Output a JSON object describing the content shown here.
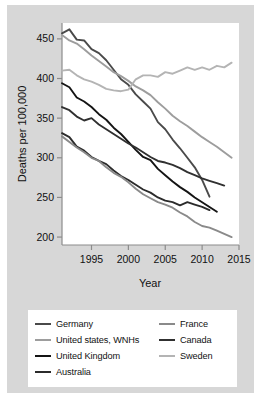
{
  "chart_data": {
    "type": "line",
    "title": "",
    "xlabel": "Year",
    "ylabel": "Deaths per 100,000",
    "xlim": [
      1991,
      2015
    ],
    "ylim": [
      190,
      470
    ],
    "xticks": [
      1995,
      2000,
      2005,
      2010,
      2015
    ],
    "yticks": [
      200,
      250,
      300,
      350,
      400,
      450
    ],
    "xtick_labels": [
      "1995",
      "2000",
      "2005",
      "2010",
      "2015"
    ],
    "ytick_labels": [
      "200",
      "250",
      "300",
      "350",
      "400",
      "450"
    ],
    "grid": false,
    "legend_position": "below",
    "legend_columns": 2,
    "series": [
      {
        "name": "Germany",
        "color": "#4a4a4a",
        "x": [
          1991,
          1992,
          1993,
          1994,
          1995,
          1996,
          1997,
          1998,
          1999,
          2000,
          2001,
          2002,
          2003,
          2004,
          2005,
          2006,
          2007,
          2008,
          2009,
          2010,
          2011
        ],
        "values": [
          457,
          462,
          449,
          448,
          437,
          432,
          423,
          411,
          399,
          392,
          380,
          371,
          362,
          345,
          336,
          323,
          312,
          300,
          288,
          272,
          251
        ]
      },
      {
        "name": "United states, WNHs",
        "color": "#9d9d9d",
        "x": [
          1991,
          1992,
          1993,
          1994,
          1995,
          1996,
          1997,
          1998,
          1999,
          2000,
          2001,
          2002,
          2003,
          2004,
          2005,
          2006,
          2007,
          2008,
          2009,
          2010,
          2011,
          2012,
          2013,
          2014
        ],
        "values": [
          455,
          448,
          444,
          437,
          429,
          422,
          415,
          408,
          403,
          397,
          390,
          385,
          379,
          370,
          362,
          353,
          346,
          340,
          333,
          326,
          320,
          314,
          307,
          300
        ]
      },
      {
        "name": "United Kingdom",
        "color": "#141414",
        "x": [
          1991,
          1992,
          1993,
          1994,
          1995,
          1996,
          1997,
          1998,
          1999,
          2000,
          2001,
          2002,
          2003,
          2004,
          2005,
          2006,
          2007,
          2008,
          2009,
          2010,
          2011,
          2012
        ],
        "values": [
          394,
          389,
          376,
          371,
          364,
          355,
          348,
          338,
          330,
          320,
          310,
          301,
          297,
          286,
          278,
          270,
          263,
          257,
          250,
          244,
          238,
          232
        ]
      },
      {
        "name": "Australia",
        "color": "#2b2b2b",
        "x": [
          1991,
          1992,
          1993,
          1994,
          1995,
          1996,
          1997,
          1998,
          1999,
          2000,
          2001,
          2002,
          2003,
          2004,
          2005,
          2006,
          2007,
          2008,
          2009,
          2010,
          2011
        ],
        "values": [
          331,
          326,
          314,
          309,
          301,
          296,
          292,
          284,
          277,
          272,
          266,
          260,
          256,
          250,
          246,
          244,
          240,
          244,
          241,
          238,
          234
        ]
      },
      {
        "name": "France",
        "color": "#8a8a8a",
        "x": [
          1991,
          1992,
          1993,
          1994,
          1995,
          1996,
          1997,
          1998,
          1999,
          2000,
          2001,
          2002,
          2003,
          2004,
          2005,
          2006,
          2007,
          2008,
          2009,
          2010,
          2011,
          2012,
          2013,
          2014
        ],
        "values": [
          327,
          320,
          313,
          307,
          300,
          296,
          288,
          281,
          276,
          269,
          261,
          254,
          249,
          244,
          241,
          237,
          231,
          226,
          219,
          214,
          212,
          208,
          204,
          200
        ]
      },
      {
        "name": "Canada",
        "color": "#303030",
        "x": [
          1991,
          1992,
          1993,
          1994,
          1995,
          1996,
          1997,
          1998,
          1999,
          2000,
          2001,
          2002,
          2003,
          2004,
          2005,
          2006,
          2007,
          2008,
          2009,
          2010,
          2011,
          2012,
          2013
        ],
        "values": [
          364,
          360,
          352,
          347,
          350,
          342,
          336,
          330,
          324,
          318,
          313,
          307,
          301,
          296,
          294,
          291,
          287,
          282,
          278,
          274,
          271,
          268,
          265
        ]
      },
      {
        "name": "Sweden",
        "color": "#b4b4b4",
        "x": [
          1991,
          1992,
          1993,
          1994,
          1995,
          1996,
          1997,
          1998,
          1999,
          2000,
          2001,
          2002,
          2003,
          2004,
          2005,
          2006,
          2007,
          2008,
          2009,
          2010,
          2011,
          2012,
          2013,
          2014
        ],
        "values": [
          410,
          411,
          404,
          399,
          396,
          392,
          387,
          385,
          384,
          386,
          399,
          404,
          404,
          402,
          408,
          406,
          410,
          414,
          411,
          414,
          411,
          416,
          414,
          420
        ]
      }
    ]
  },
  "axes": {
    "ylabel": "Deaths per 100,000",
    "xlabel": "Year"
  },
  "legend": {
    "left_column": [
      {
        "label": "Germany",
        "color": "#4a4a4a"
      },
      {
        "label": "United states, WNHs",
        "color": "#9d9d9d"
      },
      {
        "label": "United Kingdom",
        "color": "#141414"
      },
      {
        "label": "Australia",
        "color": "#2b2b2b"
      }
    ],
    "right_column": [
      {
        "label": "France",
        "color": "#8a8a8a"
      },
      {
        "label": "Canada",
        "color": "#303030"
      },
      {
        "label": "Sweden",
        "color": "#b4b4b4"
      }
    ]
  }
}
